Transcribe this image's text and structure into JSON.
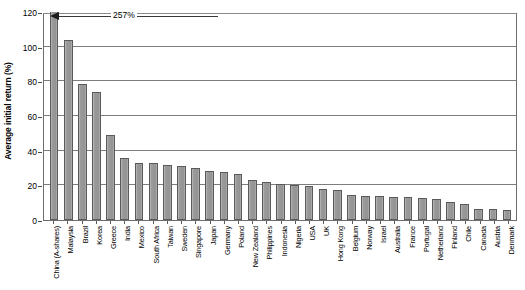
{
  "chart_data": {
    "type": "bar",
    "title": "",
    "xlabel": "",
    "ylabel": "Average initial return (%)",
    "ylim": [
      0,
      120
    ],
    "yticks": [
      0,
      20,
      40,
      60,
      80,
      100,
      120
    ],
    "ytick_labels": [
      "0",
      "20",
      "40",
      "60",
      "80",
      "100",
      "120"
    ],
    "grid": "horizontal",
    "legend": "none",
    "bar_color": "#9d9d9d",
    "bar_edge_color": "#5a5a5a",
    "annotations": [
      {
        "text": "257%",
        "points_to": "China (A-shares)",
        "note": "bar truncated at axis maximum of 120"
      }
    ],
    "categories": [
      "China (A-shares)",
      "Malaysia",
      "Brazil",
      "Korea",
      "Greece",
      "India",
      "Mexico",
      "South Africa",
      "Taiwan",
      "Sweden",
      "Singapore",
      "Japan",
      "Germany",
      "Poland",
      "New Zealand",
      "Philippines",
      "Indonesia",
      "Nigeria",
      "USA",
      "UK",
      "Hong Kong",
      "Belgium",
      "Norway",
      "Israel",
      "Australia",
      "France",
      "Portugal",
      "Netherland",
      "Finland",
      "Chile",
      "Canada",
      "Austria",
      "Denmark"
    ],
    "values": [
      257,
      104,
      78.5,
      74,
      49,
      35.5,
      33,
      33,
      31.5,
      31,
      30,
      28,
      27.5,
      26.5,
      23,
      22,
      21,
      20,
      19.5,
      18,
      17.5,
      14.5,
      14,
      14,
      13.5,
      13,
      12.5,
      12,
      10.5,
      9.5,
      6.5,
      6.5,
      5.5
    ],
    "clipped_values": [
      120,
      104,
      78.5,
      74,
      49,
      35.5,
      33,
      33,
      31.5,
      31,
      30,
      28,
      27.5,
      26.5,
      23,
      22,
      21,
      20,
      19.5,
      18,
      17.5,
      14.5,
      14,
      14,
      13.5,
      13,
      12.5,
      12,
      10.5,
      9.5,
      6.5,
      6.5,
      5.5
    ]
  }
}
